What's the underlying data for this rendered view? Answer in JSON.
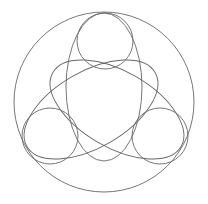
{
  "diagram": {
    "canvas": {
      "width": 208,
      "height": 204,
      "background": "#ffffff"
    },
    "stroke_color": "#666666",
    "outer_circle": {
      "cx": 104,
      "cy": 102,
      "r": 90
    },
    "ellipses": [
      {
        "name": "top",
        "cx": 104,
        "cy": 87,
        "rx": 38,
        "ry": 74,
        "rotation": 0
      },
      {
        "name": "lower-left",
        "cx": 104,
        "cy": 87,
        "rx": 38,
        "ry": 74,
        "rotation": -120
      },
      {
        "name": "lower-right",
        "cx": 104,
        "cy": 87,
        "rx": 38,
        "ry": 74,
        "rotation": 120
      }
    ],
    "small_circles": [
      {
        "name": "top",
        "cx": 105,
        "cy": 41,
        "r": 28
      },
      {
        "name": "lower-left",
        "cx": 50,
        "cy": 136,
        "r": 28
      },
      {
        "name": "lower-right",
        "cx": 160,
        "cy": 136,
        "r": 28
      }
    ]
  }
}
